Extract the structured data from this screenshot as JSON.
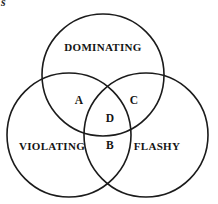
{
  "figure": {
    "type": "venn-diagram-3-set",
    "background_color": "#ffffff",
    "stroke_color": "#1b1b1b",
    "corner_fragment": "s"
  },
  "sets": [
    {
      "id": "dominating",
      "label": "DOMINATING",
      "cx": 103,
      "cy": 75,
      "r": 61
    },
    {
      "id": "violating",
      "label": "VIOLATING",
      "cx": 69,
      "cy": 135,
      "r": 62
    },
    {
      "id": "flashy",
      "label": "FLASHY",
      "cx": 146,
      "cy": 135,
      "r": 62
    }
  ],
  "set_labels": [
    {
      "text": "DOMINATING",
      "x": 103,
      "y": 47
    },
    {
      "text": "VIOLATING",
      "x": 52,
      "y": 146
    },
    {
      "text": "FLASHY",
      "x": 157,
      "y": 146
    }
  ],
  "region_labels": [
    {
      "text": "A",
      "x": 79,
      "y": 101
    },
    {
      "text": "C",
      "x": 134,
      "y": 101
    },
    {
      "text": "D",
      "x": 110,
      "y": 119
    },
    {
      "text": "B",
      "x": 110,
      "y": 146
    }
  ]
}
